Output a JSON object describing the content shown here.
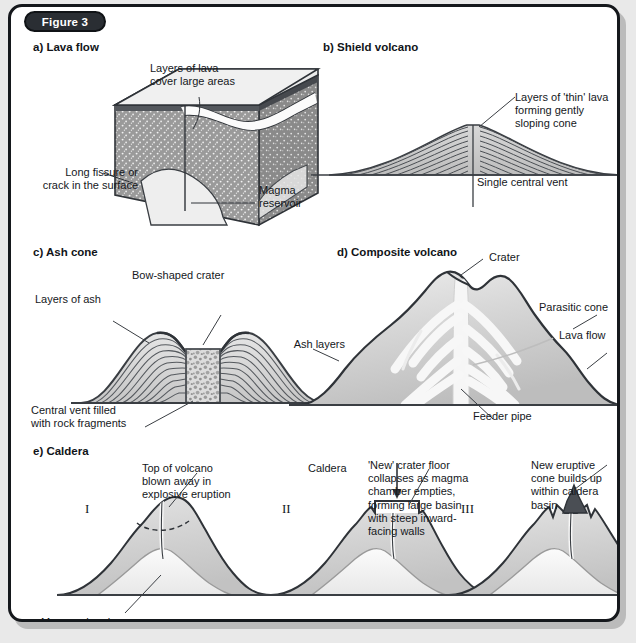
{
  "figure": {
    "badge": "Figure 3",
    "background_color": "#e9e9e9",
    "panel_color": "#ffffff",
    "border_color": "#15181c",
    "badge_color": "#2a2e33"
  },
  "panels": {
    "a": {
      "title": "a) Lava flow",
      "labels": {
        "layers": "Layers of lava\ncover large areas",
        "fissure": "Long fissure or\ncrack in the surface",
        "magma": "Magma\nreservoir"
      }
    },
    "b": {
      "title": "b) Shield volcano",
      "labels": {
        "thin_lava": "Layers of 'thin' lava\nforming gently\nsloping cone",
        "vent": "Single central vent"
      }
    },
    "c": {
      "title": "c) Ash cone",
      "labels": {
        "crater": "Bow-shaped crater",
        "ash": "Layers of ash",
        "vent": "Central vent filled\nwith rock fragments"
      }
    },
    "d": {
      "title": "d) Composite volcano",
      "labels": {
        "crater": "Crater",
        "parasitic": "Parasitic cone",
        "lava_flow": "Lava flow",
        "ash_layers": "Ash layers",
        "feeder": "Feeder pipe"
      }
    },
    "e": {
      "title": "e) Caldera",
      "stages": [
        {
          "numeral": "I",
          "label": "Top of volcano\nblown away in\nexplosive eruption",
          "extra_label": "Magma chamber"
        },
        {
          "numeral": "II",
          "label": "Caldera",
          "extra_label": "'New' crater floor\ncollapses as magma\nchamber empties,\nforming large basin\nwith steep inward-\nfacing walls"
        },
        {
          "numeral": "III",
          "label": "New eruptive\ncone builds up\nwithin caldera\nbasin"
        }
      ]
    }
  }
}
